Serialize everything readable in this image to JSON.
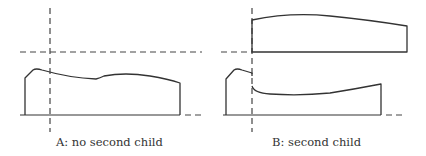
{
  "figure": {
    "panels": [
      {
        "id": "A",
        "caption": "A: no second child",
        "has_second_child": false
      },
      {
        "id": "B",
        "caption": "B: second child",
        "has_second_child": true
      }
    ]
  },
  "colors": {
    "line": "#333333",
    "dashed": "#444444",
    "background": "#ffffff"
  }
}
